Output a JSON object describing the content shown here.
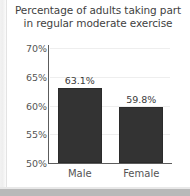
{
  "chart_data": {
    "type": "bar",
    "title": "Percentage of adults taking part in regular moderate exercise",
    "title_lines": [
      "Percentage of adults taking part",
      "in regular moderate exercise"
    ],
    "categories": [
      "Male",
      "Female"
    ],
    "values": [
      63.1,
      59.8
    ],
    "value_labels": [
      "63.1%",
      "59.8%"
    ],
    "xlabel": "",
    "ylabel": "",
    "ylim": [
      50,
      70
    ],
    "yticks": [
      50,
      55,
      60,
      65,
      70
    ],
    "ytick_labels": [
      "50%",
      "55%",
      "60%",
      "65%",
      "70%"
    ],
    "grid": true,
    "legend": false,
    "bar_color": "#333333",
    "text_color": "#555555",
    "title_color": "#3f3f3f",
    "grid_color": "#eeeeee",
    "axis_color": "#5c5c5c",
    "background_color": "#ffffff"
  }
}
